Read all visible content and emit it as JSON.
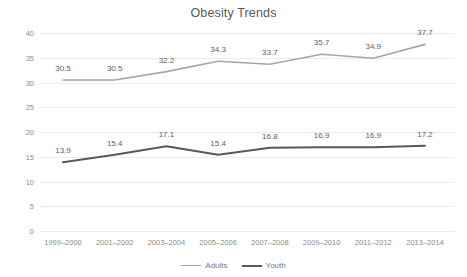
{
  "chart_data": {
    "type": "line",
    "title": "Obesity Trends",
    "xlabel": "",
    "ylabel": "",
    "categories": [
      "1999–2000",
      "2001–2002",
      "2003–2004",
      "2005–2006",
      "2007–2008",
      "2009–2010",
      "2011–2012",
      "2013–2014"
    ],
    "series": [
      {
        "name": "Adults",
        "color": "#a6a6a6",
        "line_width": 1.6,
        "values": [
          30.5,
          30.5,
          32.2,
          34.3,
          33.7,
          35.7,
          34.9,
          37.7
        ],
        "labels": [
          "30.5",
          "30.5",
          "32.2",
          "34.3",
          "33.7",
          "35.7",
          "34.9",
          "37.7"
        ]
      },
      {
        "name": "Youth",
        "color": "#595959",
        "line_width": 2.0,
        "values": [
          13.9,
          15.4,
          17.1,
          15.4,
          16.8,
          16.9,
          16.9,
          17.2
        ],
        "labels": [
          "13.9",
          "15.4",
          "17.1",
          "15.4",
          "16.8",
          "16.9",
          "16.9",
          "17.2"
        ]
      }
    ],
    "ylim": [
      0,
      40
    ],
    "yticks": [
      0,
      5,
      10,
      15,
      20,
      25,
      30,
      35,
      40
    ],
    "ytick_labels": [
      "0",
      "5",
      "10",
      "15",
      "20",
      "25",
      "30",
      "35",
      "40"
    ],
    "grid": true,
    "grid_color": "#ececed",
    "legend_position": "bottom",
    "data_labels_shown": true
  },
  "legend": {
    "entries": [
      {
        "label": "Adults"
      },
      {
        "label": "Youth"
      }
    ]
  }
}
